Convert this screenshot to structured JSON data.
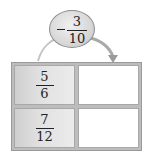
{
  "operation": {
    "sign": "−",
    "numerator": "3",
    "denominator": "10",
    "label": "subtract 3/10"
  },
  "table": {
    "rows": [
      {
        "input": {
          "numerator": "5",
          "denominator": "6"
        },
        "output": ""
      },
      {
        "input": {
          "numerator": "7",
          "denominator": "12"
        },
        "output": ""
      }
    ]
  },
  "colors": {
    "oval_fill": "#d8d8d8",
    "given_cell": "#e2e2e2",
    "blank_cell": "#ffffff",
    "border": "#9a9a9a",
    "arrow": "#b0b0b0"
  }
}
